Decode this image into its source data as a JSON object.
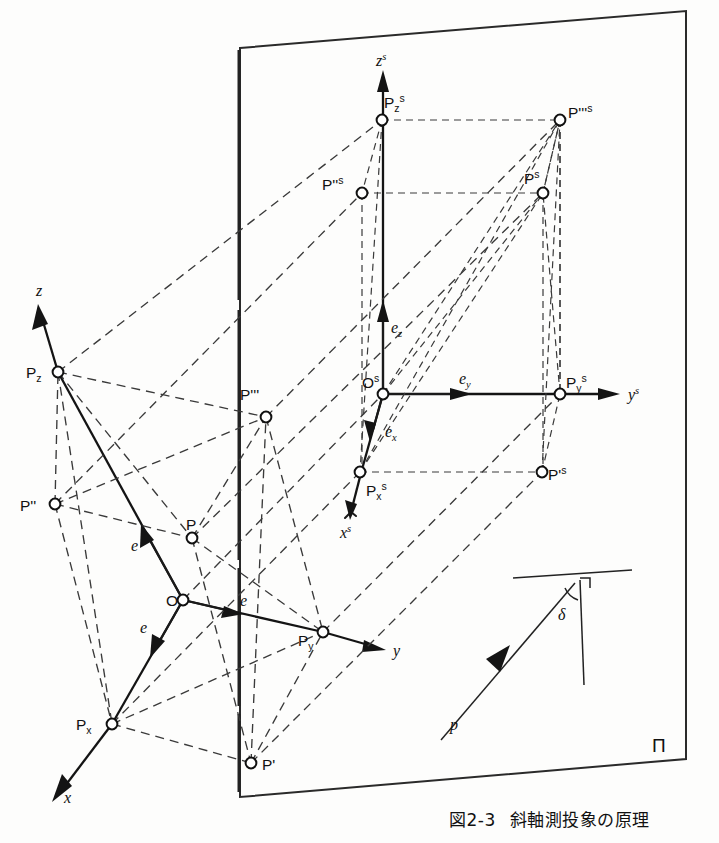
{
  "figure": {
    "caption": "図2-3　斜軸測投象の原理",
    "caption_number": "図2-3",
    "caption_title": "斜軸測投象の原理",
    "plane_label": "Π",
    "background_color": "#fdfdfc",
    "ink_color": "#111111"
  },
  "object_space": {
    "axes": [
      {
        "name": "x-axis",
        "label": "x"
      },
      {
        "name": "y-axis",
        "label": "y"
      },
      {
        "name": "z-axis",
        "label": "z"
      }
    ],
    "origin_label": "O",
    "unit_vectors": [
      {
        "name": "e-vector-x",
        "label": "e"
      },
      {
        "name": "e-vector-y",
        "label": "e"
      },
      {
        "name": "e-vector-z",
        "label": "e"
      }
    ],
    "points": [
      {
        "name": "point-P",
        "label": "P"
      },
      {
        "name": "point-P-prime",
        "label": "P'"
      },
      {
        "name": "point-P-double-prime",
        "label": "P''"
      },
      {
        "name": "point-P-triple-prime",
        "label": "P'''"
      },
      {
        "name": "point-Px",
        "label_base": "P",
        "label_sub": "x"
      },
      {
        "name": "point-Py",
        "label_base": "P",
        "label_sub": "y"
      },
      {
        "name": "point-Pz",
        "label_base": "P",
        "label_sub": "z"
      }
    ]
  },
  "image_space": {
    "axes": [
      {
        "name": "xs-axis",
        "label_base": "x",
        "label_sup": "s"
      },
      {
        "name": "ys-axis",
        "label_base": "y",
        "label_sup": "s"
      },
      {
        "name": "zs-axis",
        "label_base": "z",
        "label_sup": "s"
      }
    ],
    "origin": {
      "label_base": "O",
      "label_sup": "s"
    },
    "unit_vectors": [
      {
        "name": "ex-vector",
        "label_base": "e",
        "label_sub": "x"
      },
      {
        "name": "ey-vector",
        "label_base": "e",
        "label_sub": "y"
      },
      {
        "name": "ez-vector",
        "label_base": "e",
        "label_sub": "z"
      }
    ],
    "points": [
      {
        "name": "point-Ps",
        "label_base": "P",
        "label_sup": "s"
      },
      {
        "name": "point-Ps-prime",
        "label_base": "P'",
        "label_sup": "s"
      },
      {
        "name": "point-Ps-double-prime",
        "label_base": "P''",
        "label_sup": "s"
      },
      {
        "name": "point-Ps-triple-prime",
        "label_base": "P'''",
        "label_sup": "s"
      },
      {
        "name": "point-Psx",
        "label_base": "P",
        "label_sub": "x",
        "label_sup": "s"
      },
      {
        "name": "point-Psy",
        "label_base": "P",
        "label_sub": "y",
        "label_sup": "s"
      },
      {
        "name": "point-Psz",
        "label_base": "P",
        "label_sub": "z",
        "label_sup": "s"
      }
    ]
  },
  "angle_detail": {
    "ray_label": "p",
    "angle_label": "δ",
    "right_angle_mark": "⌐"
  }
}
